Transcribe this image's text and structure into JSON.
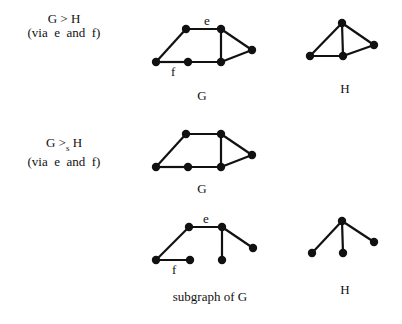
{
  "rows": [
    {
      "relation": {
        "lhs": "G",
        "op": ">",
        "sub": "",
        "rhs": "H",
        "note": "(via  e  and  f)"
      },
      "left_caption": "G",
      "right_caption": "H"
    },
    {
      "relation": {
        "lhs": "G",
        "op": ">",
        "sub": "s",
        "rhs": "H",
        "note": "(via  e  and  f)"
      },
      "left_caption": "G",
      "right_caption": ""
    },
    {
      "relation": null,
      "left_caption": "subgraph of  G",
      "right_caption": "H"
    }
  ],
  "edge_labels": {
    "e": "e",
    "f": "f"
  },
  "graphs": {
    "G_top": {
      "nodes": [
        [
          156,
          62
        ],
        [
          188,
          62
        ],
        [
          221,
          62
        ],
        [
          186,
          29
        ],
        [
          221,
          29
        ],
        [
          252,
          50
        ]
      ],
      "edges": [
        [
          3,
          4
        ],
        [
          3,
          0
        ],
        [
          0,
          1
        ],
        [
          1,
          2
        ],
        [
          4,
          2
        ],
        [
          4,
          5
        ],
        [
          2,
          5
        ]
      ]
    },
    "H_top": {
      "nodes": [
        [
          342,
          23
        ],
        [
          310,
          56
        ],
        [
          343,
          56
        ],
        [
          374,
          45
        ]
      ],
      "edges": [
        [
          0,
          1
        ],
        [
          0,
          2
        ],
        [
          0,
          3
        ],
        [
          1,
          2
        ],
        [
          2,
          3
        ]
      ]
    },
    "G_mid": {
      "nodes": [
        [
          156,
          167
        ],
        [
          188,
          167
        ],
        [
          221,
          167
        ],
        [
          186,
          134
        ],
        [
          221,
          134
        ],
        [
          252,
          155
        ]
      ],
      "edges": [
        [
          3,
          4
        ],
        [
          3,
          0
        ],
        [
          0,
          1
        ],
        [
          1,
          2
        ],
        [
          4,
          2
        ],
        [
          4,
          5
        ],
        [
          2,
          5
        ]
      ]
    },
    "G_sub": {
      "nodes": [
        [
          156,
          260
        ],
        [
          190,
          260
        ],
        [
          222,
          260
        ],
        [
          189,
          227
        ],
        [
          222,
          227
        ],
        [
          253,
          248
        ]
      ],
      "edges": [
        [
          3,
          4
        ],
        [
          3,
          0
        ],
        [
          0,
          1
        ],
        [
          4,
          2
        ],
        [
          4,
          5
        ]
      ]
    },
    "H_bot": {
      "nodes": [
        [
          342,
          221
        ],
        [
          312,
          253
        ],
        [
          343,
          253
        ],
        [
          374,
          242
        ]
      ],
      "edges": [
        [
          0,
          1
        ],
        [
          0,
          2
        ],
        [
          0,
          3
        ]
      ]
    }
  }
}
